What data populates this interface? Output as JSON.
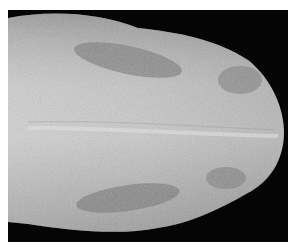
{
  "image": {
    "subject": "tongue",
    "description": "Grayscale photograph of a tongue, dorsal view, tip pointing right, on black background with white border",
    "colors": {
      "background": "#050505",
      "border": "#ffffff",
      "tissue_light": "#d8d8d8",
      "tissue_mid": "#b4b4b4",
      "lesion_dark": "#6a6a6a"
    }
  }
}
